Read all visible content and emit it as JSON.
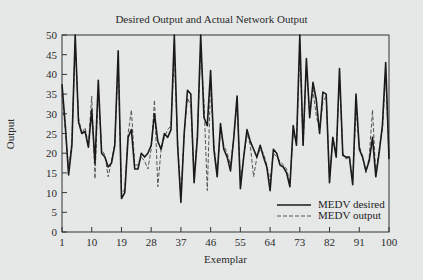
{
  "chart_data": {
    "type": "line",
    "title": "Desired Output and Actual Network Output",
    "xlabel": "Exemplar",
    "ylabel": "Output",
    "xlim": [
      1,
      100
    ],
    "ylim": [
      0,
      50
    ],
    "xticks": [
      1,
      10,
      19,
      28,
      37,
      46,
      55,
      64,
      73,
      82,
      91,
      100
    ],
    "yticks": [
      0,
      5,
      10,
      15,
      20,
      25,
      30,
      35,
      40,
      45,
      50
    ],
    "grid": false,
    "legend_position": "lower right",
    "x": [
      1,
      2,
      3,
      4,
      5,
      6,
      7,
      8,
      9,
      10,
      11,
      12,
      13,
      14,
      15,
      16,
      17,
      18,
      19,
      20,
      21,
      22,
      23,
      24,
      25,
      26,
      27,
      28,
      29,
      30,
      31,
      32,
      33,
      34,
      35,
      36,
      37,
      38,
      39,
      40,
      41,
      42,
      43,
      44,
      45,
      46,
      47,
      48,
      49,
      50,
      51,
      52,
      53,
      54,
      55,
      56,
      57,
      58,
      59,
      60,
      61,
      62,
      63,
      64,
      65,
      66,
      67,
      68,
      69,
      70,
      71,
      72,
      73,
      74,
      75,
      76,
      77,
      78,
      79,
      80,
      81,
      82,
      83,
      84,
      85,
      86,
      87,
      88,
      89,
      90,
      91,
      92,
      93,
      94,
      95,
      96,
      97,
      98,
      99,
      100
    ],
    "series": [
      {
        "name": "MEDV desired",
        "style": "solid",
        "color": "#1a1a1a",
        "values": [
          37.5,
          27,
          14.5,
          22,
          50,
          28,
          25,
          25.5,
          21.5,
          31,
          17.5,
          38.5,
          20,
          19,
          16.5,
          17.5,
          22,
          46,
          8.5,
          10,
          24,
          26,
          16,
          16,
          20,
          19,
          20,
          22,
          30,
          23,
          21,
          25,
          24,
          26,
          50,
          22,
          7.5,
          25,
          36,
          35,
          12.5,
          24,
          50,
          29,
          27,
          41,
          21,
          14,
          27.5,
          21,
          19,
          15.5,
          24,
          34.5,
          11,
          19,
          26,
          23,
          21,
          19,
          22,
          19,
          16.5,
          10.5,
          21,
          20,
          17,
          16.5,
          15,
          11.5,
          27,
          22,
          50,
          22,
          44,
          29,
          38,
          33.5,
          25,
          35.5,
          35,
          12.5,
          24,
          19,
          41.5,
          19.5,
          19,
          19,
          12,
          35,
          21,
          19,
          15.5,
          18,
          24,
          14,
          20,
          27,
          43,
          18.5
        ]
      },
      {
        "name": "MEDV output",
        "style": "dashed",
        "color": "#555555",
        "values": [
          35,
          26,
          16,
          23,
          48,
          29,
          25,
          26.5,
          22,
          34.5,
          13.5,
          36,
          21,
          19.5,
          14,
          18,
          22.5,
          43,
          9.5,
          11,
          25,
          31,
          17,
          17,
          19,
          18,
          16,
          21,
          33.5,
          11.5,
          21,
          24,
          26,
          27,
          45,
          23,
          9,
          25,
          34,
          32,
          14,
          25,
          46,
          33,
          10.5,
          38,
          22,
          15,
          26,
          22,
          20,
          17,
          24,
          33,
          13,
          19,
          25,
          22,
          14,
          19,
          21,
          20,
          17,
          13,
          20,
          19,
          18,
          17,
          16,
          12.5,
          25,
          23,
          46,
          22,
          42,
          30,
          36,
          29.5,
          26,
          33,
          34.5,
          13.5,
          24,
          20,
          39,
          20,
          18.5,
          19,
          13,
          31,
          22,
          19,
          15,
          19,
          31,
          14.5,
          21,
          26,
          40,
          19
        ]
      }
    ]
  },
  "legend": {
    "items": [
      {
        "label": "MEDV desired",
        "style": "solid"
      },
      {
        "label": "MEDV output",
        "style": "dashed"
      }
    ]
  },
  "colors": {
    "background": "#e6e8e8",
    "axis": "#333333",
    "desired": "#1a1a1a",
    "output": "#555555"
  }
}
